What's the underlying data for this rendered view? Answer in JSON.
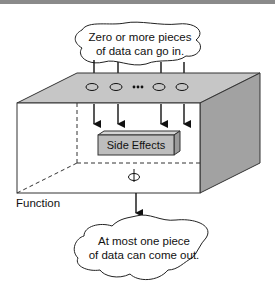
{
  "diagram": {
    "title": "Function",
    "input_cloud": {
      "line1": "Zero or more pieces",
      "line2": "of data can go in."
    },
    "side_effects_label": "Side Effects",
    "output_cloud": {
      "line1": "At most one piece",
      "line2": "of data can come out."
    },
    "ellipsis": "•••",
    "input_count_shown": 4,
    "output_count_max": 1,
    "colors": {
      "top_face": "#c6c6c6",
      "right_face": "#a2a2a2",
      "side_effects_box": "#bdbdbd",
      "outline": "#222222",
      "top_rule": "#8a8a8a"
    }
  }
}
